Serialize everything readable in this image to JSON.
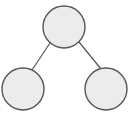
{
  "diagram": {
    "type": "tree",
    "colors": {
      "node_fill": "#ececec",
      "node_stroke": "#555555",
      "edge_stroke": "#555555",
      "background": "#ffffff"
    },
    "nodes": [
      {
        "id": "root",
        "label": "",
        "cx": 64,
        "cy": 27,
        "r": 21
      },
      {
        "id": "left-child",
        "label": "",
        "cx": 23,
        "cy": 89,
        "r": 21
      },
      {
        "id": "right-child",
        "label": "",
        "cx": 106,
        "cy": 89,
        "r": 21
      }
    ],
    "edges": [
      {
        "from": "root",
        "to": "left-child",
        "x1": 50,
        "y1": 43,
        "x2": 32,
        "y2": 70
      },
      {
        "from": "root",
        "to": "right-child",
        "x1": 79,
        "y1": 42,
        "x2": 101,
        "y2": 69
      }
    ]
  }
}
